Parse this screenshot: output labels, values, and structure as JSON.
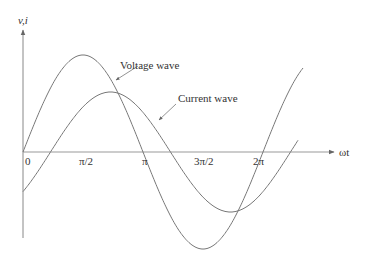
{
  "diagram": {
    "title": "",
    "y_axis_label": "v,i",
    "x_axis_label": "ωt",
    "x_ticks": [
      "0",
      "π/2",
      "π",
      "3π/2",
      "2π"
    ],
    "annotations": {
      "voltage": "Voltage wave",
      "current": "Current wave"
    },
    "colors": {
      "line": "#777777",
      "axis": "#888888",
      "text": "#333333"
    }
  },
  "chart_data": {
    "type": "line",
    "title": "",
    "xlabel": "ωt",
    "ylabel": "v,i",
    "x_ticks": [
      "0",
      "π/2",
      "π",
      "3π/2",
      "2π"
    ],
    "series": [
      {
        "name": "Voltage wave",
        "function": "Vm·sin(ωt)",
        "amplitude": 1.0,
        "phase_deg": 0
      },
      {
        "name": "Current wave",
        "function": "Im·sin(ωt − φ)",
        "amplitude": 0.62,
        "phase_deg": -45
      }
    ],
    "grid": false,
    "legend": "annotations with arrows"
  }
}
